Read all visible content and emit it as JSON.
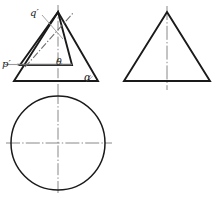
{
  "drawing": {
    "title": "Orthographic projection of a cone with an inclined section",
    "labels": {
      "q_prime": "q′",
      "p_prime": "p′",
      "theta": "θ",
      "alpha": "α"
    },
    "colors": {
      "outline": "#1a1a1a",
      "centerline": "#7a7a7a",
      "leader": "#8a8a8a",
      "background": "#ffffff"
    },
    "views": {
      "front": {
        "name": "front-view",
        "outer_triangle": {
          "apex": [
            58,
            12
          ],
          "base_left": [
            14,
            81
          ],
          "base_right": [
            98,
            81
          ]
        },
        "inner_triangle": {
          "apex": [
            58,
            12
          ],
          "base_left": [
            20,
            65
          ],
          "base_right": [
            72,
            65
          ]
        },
        "angle_theta_label_pos": [
          59,
          64
        ],
        "angle_alpha_label_pos": [
          86,
          79
        ]
      },
      "side": {
        "name": "side-view",
        "triangle": {
          "apex": [
            167,
            12
          ],
          "base_left": [
            124,
            81
          ],
          "base_right": [
            210,
            81
          ]
        }
      },
      "top": {
        "name": "top-view",
        "circle": {
          "cx": 58,
          "cy": 143,
          "r": 47
        }
      }
    },
    "lines": {
      "p_to_q_dashdot": {
        "from": [
          26,
          66
        ],
        "to": [
          72,
          14
        ]
      },
      "p_horizontal": {
        "from": [
          18,
          64
        ],
        "to": [
          72,
          64
        ]
      },
      "q_leader": {
        "from": [
          42,
          14
        ],
        "to": [
          62,
          37
        ]
      },
      "vertical_centerline": {
        "x": 58,
        "from_y": 5,
        "to_y": 195
      },
      "horizontal_centerline": {
        "y": 143,
        "from_x": 6,
        "to_x": 112
      },
      "side_vertical_centerline": {
        "x": 167,
        "from_y": 5,
        "to_y": 90
      }
    }
  }
}
